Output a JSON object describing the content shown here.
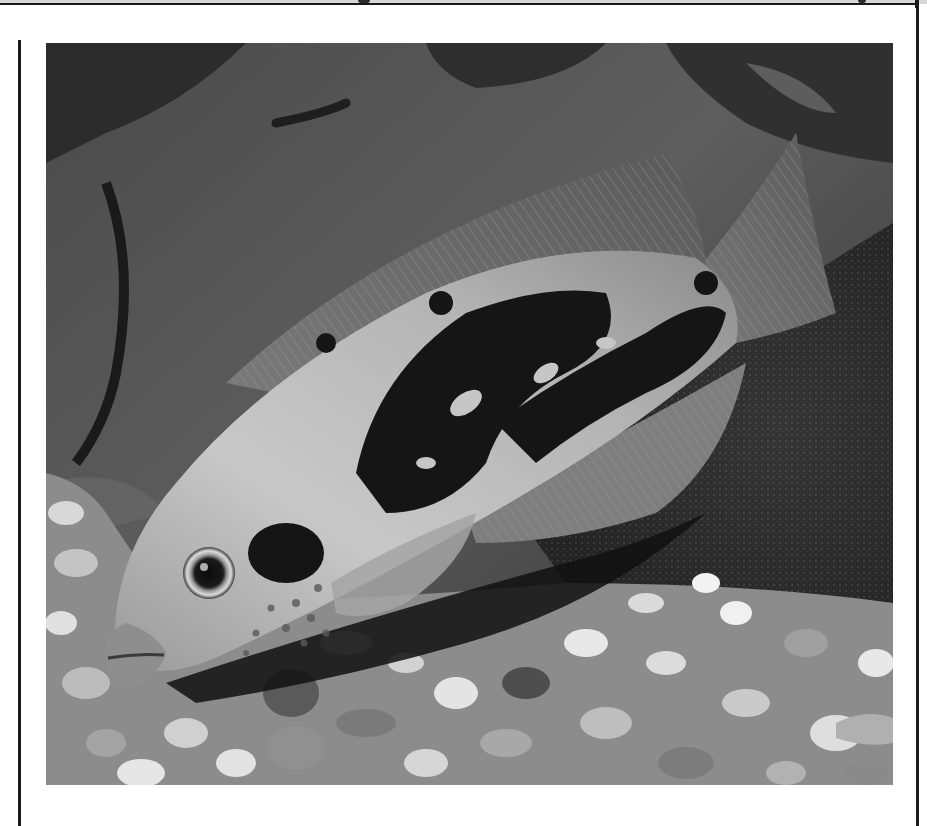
{
  "page": {
    "type": "scanned-book-page",
    "header_text_visible": false
  },
  "figure": {
    "color_mode": "grayscale",
    "caption": null
  },
  "colors": {
    "page_background": "#ffffff",
    "rule_color": "#1a1a1a",
    "photo_dark": "#1c1c1c",
    "photo_mid": "#6e6e6e",
    "photo_light": "#d6d6d6"
  }
}
